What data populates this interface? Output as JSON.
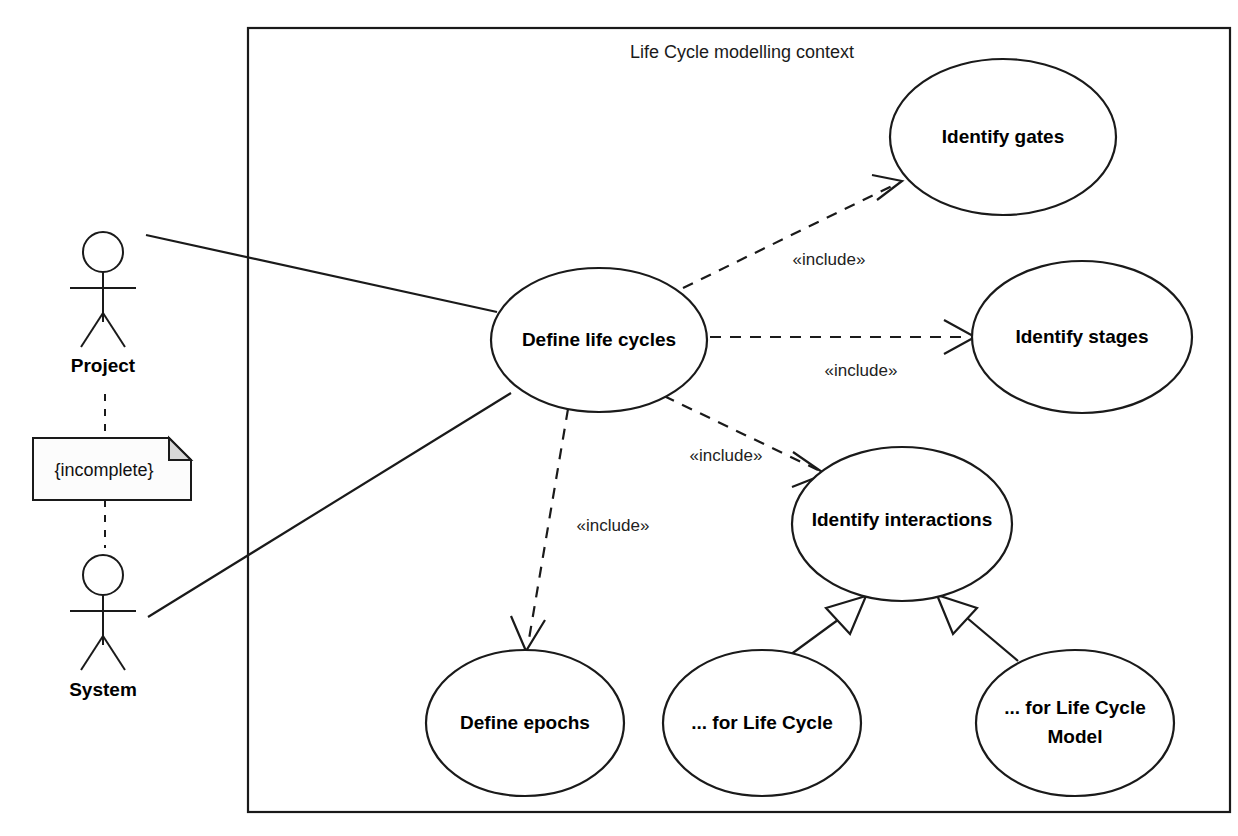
{
  "diagram": {
    "kind": "uml-use-case-diagram",
    "frame": {
      "title": "Life Cycle modelling context",
      "x": 248,
      "y": 28,
      "width": 982,
      "height": 784
    },
    "colors": {
      "stroke": "#1a1a1a",
      "fill": "#ffffff",
      "note_fill": "#fcfcfc",
      "note_fold": "#d8d8d8"
    },
    "actors": [
      {
        "id": "project",
        "label": "Project",
        "cx": 103,
        "cy": 262,
        "label_y": 355
      },
      {
        "id": "system",
        "label": "System",
        "cx": 103,
        "cy": 585,
        "label_y": 682
      }
    ],
    "note": {
      "id": "incomplete-note",
      "label": "{incomplete}",
      "x": 33,
      "y": 438,
      "width": 158,
      "height": 62,
      "fold": 22
    },
    "use_cases": [
      {
        "id": "define-life-cycles",
        "label": "Define life cycles",
        "cx": 599,
        "cy": 340,
        "rx": 108,
        "ry": 72
      },
      {
        "id": "identify-gates",
        "label": "Identify gates",
        "cx": 1003,
        "cy": 137,
        "rx": 113,
        "ry": 78
      },
      {
        "id": "identify-stages",
        "label": "Identify stages",
        "cx": 1082,
        "cy": 337,
        "rx": 110,
        "ry": 76
      },
      {
        "id": "identify-interactions",
        "label": "Identify interactions",
        "cx": 902,
        "cy": 524,
        "rx": 110,
        "ry": 77
      },
      {
        "id": "define-epochs",
        "label": "Define epochs",
        "cx": 525,
        "cy": 723,
        "rx": 99,
        "ry": 73
      },
      {
        "id": "for-life-cycle",
        "label": "... for Life Cycle",
        "cx": 762,
        "cy": 723,
        "rx": 99,
        "ry": 73
      },
      {
        "id": "for-life-cycle-model",
        "label_line1": "... for Life Cycle",
        "label_line2": "Model",
        "cx": 1075,
        "cy": 723,
        "rx": 99,
        "ry": 73
      }
    ],
    "relationships": [
      {
        "id": "assoc-project-define",
        "type": "association",
        "from": "project",
        "to": "define-life-cycles",
        "label": ""
      },
      {
        "id": "assoc-system-define",
        "type": "association",
        "from": "system",
        "to": "define-life-cycles",
        "label": ""
      },
      {
        "id": "include-gates",
        "type": "include",
        "from": "define-life-cycles",
        "to": "identify-gates",
        "label": "«include»",
        "label_x": 829,
        "label_y": 258
      },
      {
        "id": "include-stages",
        "type": "include",
        "from": "define-life-cycles",
        "to": "identify-stages",
        "label": "«include»",
        "label_x": 861,
        "label_y": 369
      },
      {
        "id": "include-interactions",
        "type": "include",
        "from": "define-life-cycles",
        "to": "identify-interactions",
        "label": "«include»",
        "label_x": 726,
        "label_y": 454
      },
      {
        "id": "include-epochs",
        "type": "include",
        "from": "define-life-cycles",
        "to": "define-epochs",
        "label": "«include»",
        "label_x": 613,
        "label_y": 524
      },
      {
        "id": "gen-life-cycle",
        "type": "generalization",
        "from": "for-life-cycle",
        "to": "identify-interactions",
        "label": ""
      },
      {
        "id": "gen-life-cycle-model",
        "type": "generalization",
        "from": "for-life-cycle-model",
        "to": "identify-interactions",
        "label": ""
      },
      {
        "id": "note-anchor-project",
        "type": "note-anchor",
        "from": "incomplete-note",
        "to": "project",
        "label": ""
      },
      {
        "id": "note-anchor-system",
        "type": "note-anchor",
        "from": "incomplete-note",
        "to": "system",
        "label": ""
      }
    ]
  }
}
